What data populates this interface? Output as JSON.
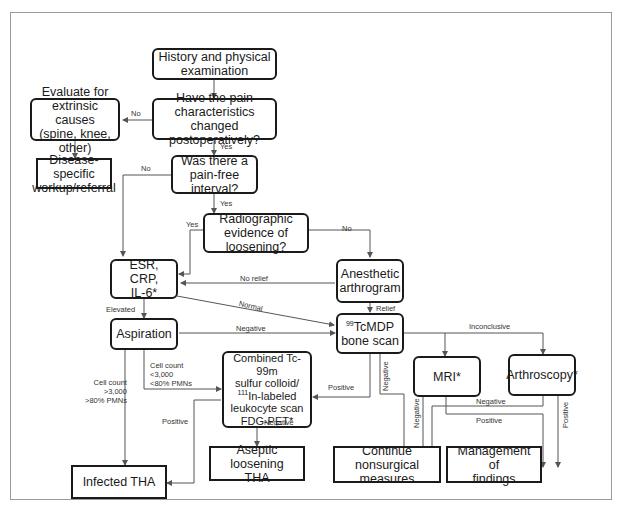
{
  "diagram": {
    "nodes": {
      "history": "History and physical\nexamination",
      "pain_changed": "Have the pain characteristics\nchanged postoperatively?",
      "extrinsic": "Evaluate for\nextrinsic causes\n(spine, knee, other)",
      "disease_specific": "Disease-specific\nworkup/referral",
      "pain_free": "Was there a pain-free\ninterval?",
      "radiographic": "Radiographic\nevidence of\nloosening?",
      "esr": "ESR, CRP,\nIL-6*",
      "anesthetic": "Anesthetic\narthrogram",
      "aspiration": "Aspiration",
      "bone_scan_sup": "99",
      "bone_scan": "TcMDP\nbone scan",
      "combined_line1": "Combined Tc-99m\nsulfur colloid/",
      "combined_sup": "111",
      "combined_line2": "In-labeled\nleukocyte scan\nFDG-PET*",
      "mri": "MRI*",
      "arthroscopy": "Arthroscopy*",
      "infected": "Infected THA",
      "aseptic": "Aseptic loosening\nTHA",
      "continue": "Continue nonsurgical\nmeasures",
      "management": "Management of\nfindings"
    },
    "edge_labels": {
      "pain_changed_no": "No",
      "pain_changed_yes": "Yes",
      "pain_free_no": "No",
      "pain_free_yes": "Yes",
      "radiographic_yes": "Yes",
      "radiographic_no": "No",
      "no_relief": "No relief",
      "relief": "Relief",
      "normal": "Normal",
      "elevated": "Elevated",
      "aspiration_negative": "Negative",
      "cell_low": "Cell count\n<3,000\n<80% PMNs",
      "cell_high": "Cell count\n>3,000\n>80% PMNs",
      "combined_positive": "Positive",
      "combined_negative": "Negative",
      "bone_positive": "Positive",
      "bone_negative": "Negative",
      "inconclusive": "Inconclusive",
      "mri_negative": "Negative",
      "mri_positive": "Positive",
      "arthro_negative": "Negative",
      "arthro_positive": "Positive"
    }
  },
  "colors": {
    "stroke": "#1a1a1a",
    "edge": "#555555",
    "frame": "#9a9a9a",
    "background": "#ffffff"
  }
}
